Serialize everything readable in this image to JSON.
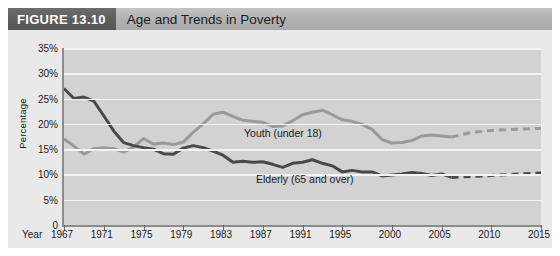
{
  "header": {
    "figure_number": "FIGURE 13.10",
    "title": "Age and Trends in Poverty",
    "number_block_color": "#5e5e5e",
    "bar_color": "#b4b4b4"
  },
  "axes": {
    "y_title": "Percentage",
    "x_title": "Year",
    "y_ticks": [
      "0",
      "5%",
      "10%",
      "15%",
      "20%",
      "25%",
      "30%",
      "35%"
    ],
    "x_ticks": [
      "1967",
      "1971",
      "1975",
      "1979",
      "1983",
      "1987",
      "1991",
      "1995",
      "2000",
      "2005",
      "2010",
      "2015"
    ]
  },
  "legend": {
    "youth_label": "Youth (under 18)",
    "elderly_label": "Elderly (65 and over)"
  },
  "colors": {
    "plot_background": "#d2d2d2",
    "panel_background": "#e9e9e9",
    "gridline": "#f4f4f4",
    "axis": "#8c8c8c",
    "youth_line": "#9a9a9a",
    "elderly_line": "#494949"
  },
  "chart_data": {
    "type": "line",
    "title": "Age and Trends in Poverty",
    "xlabel": "Year",
    "ylabel": "Percentage",
    "xlim": [
      1967,
      2015
    ],
    "ylim": [
      0,
      35
    ],
    "grid": true,
    "legend_position": "inline-annotation",
    "x_tick_values": [
      1967,
      1971,
      1975,
      1979,
      1983,
      1987,
      1991,
      1995,
      2000,
      2005,
      2010,
      2015
    ],
    "y_tick_values": [
      0,
      5,
      10,
      15,
      20,
      25,
      30,
      35
    ],
    "y_tick_labels": [
      "0",
      "5%",
      "10%",
      "15%",
      "20%",
      "25%",
      "30%",
      "35%"
    ],
    "projection_starts_at": 2006,
    "annotations": [
      {
        "text": "Youth (under 18)",
        "x": 1988,
        "y": 24.5
      },
      {
        "text": "Elderly (65 and over)",
        "x": 1990,
        "y": 15.5
      }
    ],
    "series": [
      {
        "name": "Youth (under 18)",
        "color": "#9a9a9a",
        "x": [
          1967,
          1968,
          1969,
          1970,
          1971,
          1972,
          1973,
          1974,
          1975,
          1976,
          1977,
          1978,
          1979,
          1980,
          1981,
          1982,
          1983,
          1984,
          1985,
          1986,
          1987,
          1988,
          1989,
          1990,
          1991,
          1992,
          1993,
          1994,
          1995,
          1996,
          1997,
          1998,
          1999,
          2000,
          2001,
          2002,
          2003,
          2004,
          2005,
          2006
        ],
        "y": [
          17.0,
          15.6,
          14.0,
          15.1,
          15.3,
          15.1,
          14.4,
          15.4,
          17.1,
          16.0,
          16.2,
          15.9,
          16.4,
          18.3,
          20.0,
          21.9,
          22.3,
          21.5,
          20.7,
          20.5,
          20.3,
          19.5,
          19.6,
          20.6,
          21.8,
          22.3,
          22.7,
          21.8,
          20.8,
          20.5,
          19.9,
          18.9,
          16.9,
          16.2,
          16.3,
          16.7,
          17.6,
          17.8,
          17.6,
          17.4
        ],
        "projection_x": [
          2006,
          2008,
          2010,
          2012,
          2015
        ],
        "projection_y": [
          17.4,
          18.3,
          18.7,
          18.9,
          19.1
        ],
        "style": "solid-then-dashed"
      },
      {
        "name": "Elderly (65 and over)",
        "color": "#494949",
        "x": [
          1967,
          1968,
          1969,
          1970,
          1971,
          1972,
          1973,
          1974,
          1975,
          1976,
          1977,
          1978,
          1979,
          1980,
          1981,
          1982,
          1983,
          1984,
          1985,
          1986,
          1987,
          1988,
          1989,
          1990,
          1991,
          1992,
          1993,
          1994,
          1995,
          1996,
          1997,
          1998,
          1999,
          2000,
          2001,
          2002,
          2003,
          2004,
          2005,
          2006
        ],
        "y": [
          27.0,
          25.0,
          25.3,
          24.5,
          21.6,
          18.6,
          16.3,
          15.7,
          15.3,
          15.0,
          14.1,
          14.0,
          15.2,
          15.7,
          15.3,
          14.6,
          13.8,
          12.4,
          12.6,
          12.4,
          12.5,
          12.0,
          11.4,
          12.2,
          12.4,
          12.9,
          12.2,
          11.7,
          10.5,
          10.8,
          10.5,
          10.5,
          9.7,
          9.9,
          10.1,
          10.4,
          10.2,
          9.8,
          10.1,
          9.4
        ],
        "projection_x": [
          2006,
          2008,
          2010,
          2012,
          2015
        ],
        "projection_y": [
          9.4,
          9.6,
          9.8,
          10.0,
          10.3
        ],
        "style": "solid-then-dashed"
      }
    ]
  }
}
